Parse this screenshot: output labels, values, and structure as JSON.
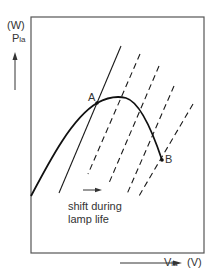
{
  "diagram": {
    "y_unit": "(W)",
    "y_label_main": "P",
    "y_label_sub": "la",
    "x_label_main": "V",
    "x_label_sub": "la",
    "x_unit": "(V)",
    "point_a": "A",
    "point_b": "B",
    "annotation_line1": "shift during",
    "annotation_line2": "lamp life",
    "colors": {
      "line": "#1a1a1a",
      "frame": "#555555",
      "background": "#ffffff"
    },
    "elements": {
      "power_curve": "Lamp power vs lamp voltage, rising from bottom-left to maximum then falling to B",
      "solid_load_line": "Initial ballast/supply line crossing curve at A",
      "dashed_load_lines": 4
    }
  }
}
